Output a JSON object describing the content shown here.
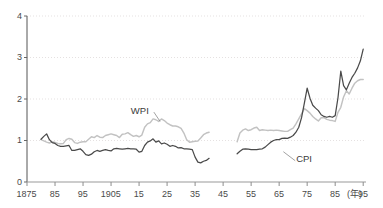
{
  "chart_data": {
    "type": "line",
    "title": "",
    "subtitle": "",
    "xlabel": "(年)",
    "ylabel": "",
    "xlim": [
      1875,
      1996
    ],
    "ylim": [
      0,
      4
    ],
    "grid": true,
    "grid_axis": "y",
    "legend_position": "inline-annotation",
    "x_tick_labels": [
      "1875",
      "85",
      "95",
      "1905",
      "15",
      "25",
      "35",
      "45",
      "55",
      "65",
      "75",
      "85",
      "95"
    ],
    "x_tick_values": [
      1875,
      1885,
      1895,
      1905,
      1915,
      1925,
      1935,
      1945,
      1955,
      1965,
      1975,
      1985,
      1995
    ],
    "y_tick_labels": [
      "0",
      "1",
      "2",
      "3",
      "4"
    ],
    "y_tick_values": [
      0,
      1,
      2,
      3,
      4
    ],
    "annotations": [
      {
        "text": "WPI",
        "x": 1916,
        "y": 1.72,
        "leader_to_x": 1922.5,
        "leader_to_y": 1.46
      },
      {
        "text": "CPI",
        "x": 1975,
        "y": 0.55,
        "leader_to_x": 1966.5,
        "leader_to_y": 0.73
      }
    ],
    "series": [
      {
        "name": "WPI",
        "color": "#c2c2c2",
        "x": [
          1880,
          1881,
          1882,
          1883,
          1884,
          1885,
          1886,
          1887,
          1888,
          1889,
          1890,
          1891,
          1892,
          1893,
          1894,
          1895,
          1896,
          1897,
          1898,
          1899,
          1900,
          1901,
          1902,
          1903,
          1904,
          1905,
          1906,
          1907,
          1908,
          1909,
          1910,
          1911,
          1912,
          1913,
          1914,
          1915,
          1916,
          1917,
          1918,
          1919,
          1920,
          1921,
          1922,
          1923,
          1924,
          1925,
          1926,
          1927,
          1928,
          1929,
          1930,
          1931,
          1932,
          1933,
          1934,
          1935,
          1936,
          1937,
          1938,
          1939,
          1940,
          1950,
          1951,
          1952,
          1953,
          1954,
          1955,
          1956,
          1957,
          1958,
          1959,
          1960,
          1961,
          1962,
          1963,
          1964,
          1965,
          1966,
          1967,
          1968,
          1969,
          1970,
          1971,
          1972,
          1973,
          1974,
          1975,
          1976,
          1977,
          1978,
          1979,
          1980,
          1981,
          1982,
          1983,
          1984,
          1985,
          1986,
          1987,
          1988,
          1989,
          1990,
          1991,
          1992,
          1993,
          1994,
          1995
        ],
        "y": [
          1.02,
          0.99,
          0.96,
          0.94,
          0.97,
          0.95,
          0.93,
          0.92,
          0.93,
          1.02,
          1.05,
          1.03,
          0.95,
          0.93,
          0.96,
          0.97,
          0.97,
          1.03,
          1.09,
          1.07,
          1.12,
          1.08,
          1.07,
          1.12,
          1.14,
          1.16,
          1.14,
          1.12,
          1.07,
          1.15,
          1.16,
          1.19,
          1.14,
          1.1,
          1.12,
          1.09,
          1.13,
          1.32,
          1.4,
          1.43,
          1.52,
          1.5,
          1.46,
          1.52,
          1.48,
          1.42,
          1.38,
          1.35,
          1.35,
          1.33,
          1.29,
          1.18,
          1.02,
          0.96,
          0.97,
          0.98,
          0.99,
          1.06,
          1.14,
          1.18,
          1.2,
          0.97,
          1.18,
          1.25,
          1.28,
          1.24,
          1.26,
          1.3,
          1.32,
          1.24,
          1.26,
          1.25,
          1.24,
          1.25,
          1.24,
          1.25,
          1.24,
          1.23,
          1.22,
          1.22,
          1.26,
          1.3,
          1.4,
          1.52,
          1.64,
          1.77,
          1.72,
          1.66,
          1.58,
          1.52,
          1.47,
          1.55,
          1.55,
          1.51,
          1.49,
          1.48,
          1.46,
          1.68,
          1.8,
          2.05,
          2.2,
          2.12,
          2.26,
          2.38,
          2.44,
          2.47,
          2.47
        ]
      },
      {
        "name": "CPI",
        "color": "#4a4a4a",
        "x": [
          1880,
          1881,
          1882,
          1883,
          1884,
          1885,
          1886,
          1887,
          1888,
          1889,
          1890,
          1891,
          1892,
          1893,
          1894,
          1895,
          1896,
          1897,
          1898,
          1899,
          1900,
          1901,
          1902,
          1903,
          1904,
          1905,
          1906,
          1907,
          1908,
          1909,
          1910,
          1911,
          1912,
          1913,
          1914,
          1915,
          1916,
          1917,
          1918,
          1919,
          1920,
          1921,
          1922,
          1923,
          1924,
          1925,
          1926,
          1927,
          1928,
          1929,
          1930,
          1931,
          1932,
          1933,
          1934,
          1935,
          1936,
          1937,
          1938,
          1939,
          1940,
          1950,
          1951,
          1952,
          1953,
          1954,
          1955,
          1956,
          1957,
          1958,
          1959,
          1960,
          1961,
          1962,
          1963,
          1964,
          1965,
          1966,
          1967,
          1968,
          1969,
          1970,
          1971,
          1972,
          1973,
          1974,
          1975,
          1976,
          1977,
          1978,
          1979,
          1980,
          1981,
          1982,
          1983,
          1984,
          1985,
          1986,
          1987,
          1988,
          1989,
          1990,
          1991,
          1992,
          1993,
          1994,
          1995
        ],
        "y": [
          1.03,
          1.1,
          1.16,
          1.02,
          0.95,
          0.93,
          0.88,
          0.86,
          0.86,
          0.87,
          0.88,
          0.76,
          0.76,
          0.78,
          0.8,
          0.74,
          0.66,
          0.64,
          0.67,
          0.73,
          0.76,
          0.74,
          0.76,
          0.78,
          0.76,
          0.75,
          0.8,
          0.81,
          0.8,
          0.79,
          0.8,
          0.81,
          0.8,
          0.8,
          0.79,
          0.72,
          0.74,
          0.88,
          0.96,
          0.99,
          1.04,
          0.96,
          0.99,
          0.92,
          0.94,
          0.91,
          0.86,
          0.88,
          0.86,
          0.82,
          0.83,
          0.8,
          0.8,
          0.79,
          0.78,
          0.6,
          0.48,
          0.46,
          0.5,
          0.52,
          0.57,
          0.68,
          0.74,
          0.79,
          0.8,
          0.79,
          0.78,
          0.78,
          0.78,
          0.79,
          0.8,
          0.84,
          0.9,
          0.96,
          1.0,
          1.02,
          1.02,
          1.05,
          1.06,
          1.05,
          1.08,
          1.12,
          1.2,
          1.32,
          1.55,
          1.9,
          2.26,
          2.02,
          1.85,
          1.78,
          1.72,
          1.62,
          1.58,
          1.56,
          1.58,
          1.56,
          1.6,
          2.03,
          2.67,
          2.32,
          2.22,
          2.38,
          2.52,
          2.62,
          2.75,
          2.92,
          3.2
        ]
      }
    ]
  },
  "axes": {
    "x_unit_label": "(年)"
  }
}
